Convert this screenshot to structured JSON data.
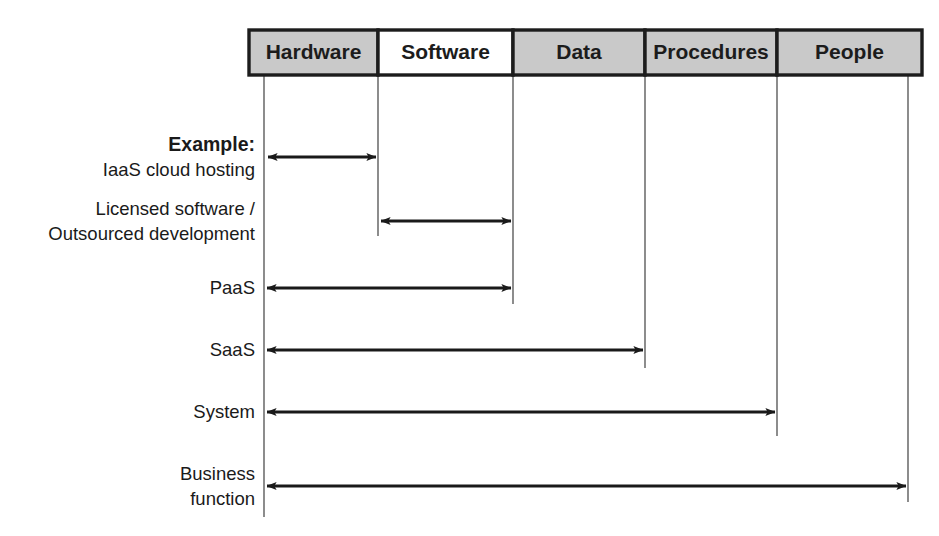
{
  "diagram": {
    "colors": {
      "header_fill_shaded": "#c9c9c9",
      "header_fill_plain": "#ffffff",
      "header_border": "#1c1c1c",
      "arrow_color": "#1a1a1a",
      "column_line": "#707070",
      "text": "#1a1a1a"
    },
    "columns": [
      {
        "label": "Hardware",
        "shaded": true,
        "x0": 249,
        "x1": 378
      },
      {
        "label": "Software",
        "shaded": false,
        "x0": 378,
        "x1": 513
      },
      {
        "label": "Data",
        "shaded": true,
        "x0": 513,
        "x1": 645
      },
      {
        "label": "Procedures",
        "shaded": true,
        "x0": 645,
        "x1": 777
      },
      {
        "label": "People",
        "shaded": true,
        "x0": 777,
        "x1": 922
      }
    ],
    "header": {
      "y0": 30,
      "y1": 75
    },
    "column_lines": [
      {
        "x": 264,
        "y0": 75,
        "y1": 517
      },
      {
        "x": 378,
        "y0": 75,
        "y1": 236
      },
      {
        "x": 513,
        "y0": 75,
        "y1": 304
      },
      {
        "x": 645,
        "y0": 75,
        "y1": 368
      },
      {
        "x": 777,
        "y0": 75,
        "y1": 436
      },
      {
        "x": 908,
        "y0": 75,
        "y1": 502
      }
    ],
    "rows": [
      {
        "id": "iaas",
        "label_lines": [
          "Example:",
          "IaaS cloud hosting"
        ],
        "label_bold": [
          true,
          false
        ],
        "y": 157,
        "x_start": 268,
        "x_end": 376,
        "arrow_start": true,
        "arrow_end": true,
        "span": "Hardware"
      },
      {
        "id": "licensed-software",
        "label_lines": [
          "Licensed software /",
          "Outsourced development"
        ],
        "label_bold": [
          false,
          false
        ],
        "y": 221,
        "x_start": 381,
        "x_end": 511,
        "arrow_start": true,
        "arrow_end": true,
        "span": "Software"
      },
      {
        "id": "paas",
        "label_lines": [
          "PaaS"
        ],
        "label_bold": [
          false
        ],
        "y": 288,
        "x_start": 267,
        "x_end": 511,
        "arrow_start": true,
        "arrow_end": true,
        "span": "Hardware–Software"
      },
      {
        "id": "saas",
        "label_lines": [
          "SaaS"
        ],
        "label_bold": [
          false
        ],
        "y": 350,
        "x_start": 267,
        "x_end": 643,
        "arrow_start": true,
        "arrow_end": true,
        "span": "Hardware–Data"
      },
      {
        "id": "system",
        "label_lines": [
          "System"
        ],
        "label_bold": [
          false
        ],
        "y": 412,
        "x_start": 267,
        "x_end": 775,
        "arrow_start": true,
        "arrow_end": true,
        "span": "Hardware–Procedures"
      },
      {
        "id": "business-function",
        "label_lines": [
          "Business",
          "function"
        ],
        "label_bold": [
          false,
          false
        ],
        "y": 486,
        "x_start": 267,
        "x_end": 906,
        "arrow_start": true,
        "arrow_end": true,
        "span": "Hardware–People"
      }
    ],
    "label_right_edge": 255
  }
}
